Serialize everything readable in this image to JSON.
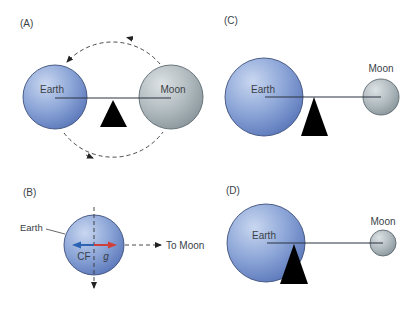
{
  "panels": {
    "A": {
      "label": "(A)",
      "earth": "Earth",
      "moon": "Moon"
    },
    "B": {
      "label": "(B)",
      "earth": "Earth",
      "cf": "CF",
      "g": "g",
      "to_moon": "To Moon"
    },
    "C": {
      "label": "(C)",
      "earth": "Earth",
      "moon": "Moon"
    },
    "D": {
      "label": "(D)",
      "earth": "Earth",
      "moon": "Moon"
    }
  },
  "colors": {
    "earth_light": "#c4d3ee",
    "earth_dark": "#5876b8",
    "earth_outline": "#3d4f7a",
    "moon_light": "#d6dcdf",
    "moon_dark": "#87949a",
    "moon_outline": "#5d6a70",
    "cf_arrow": "#2d63b3",
    "g_arrow": "#d0403a",
    "fulcrum": "#000000"
  }
}
